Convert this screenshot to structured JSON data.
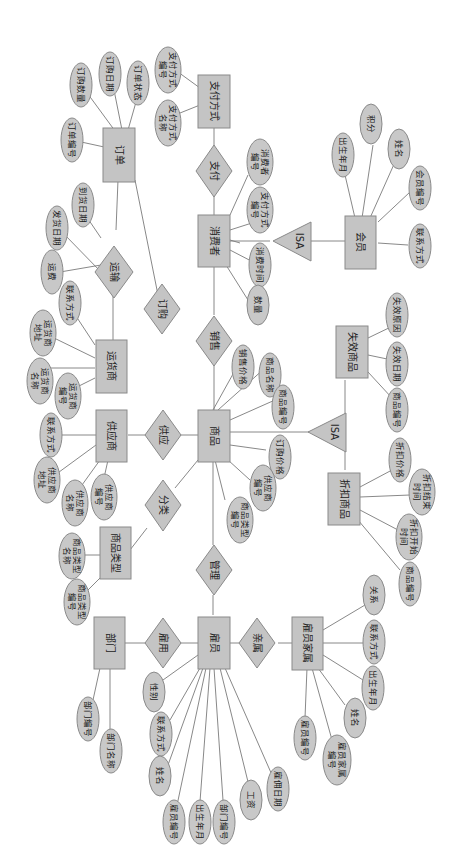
{
  "diagram": {
    "type": "ER diagram (Chen notation), rendered rotated 90° clockwise",
    "entities": [
      {
        "id": "order",
        "label": "订单"
      },
      {
        "id": "payment",
        "label": "支付方式"
      },
      {
        "id": "carrier",
        "label": "运货商"
      },
      {
        "id": "consumer",
        "label": "消费者"
      },
      {
        "id": "member",
        "label": "会员"
      },
      {
        "id": "supplier",
        "label": "供应商"
      },
      {
        "id": "product",
        "label": "商品"
      },
      {
        "id": "category",
        "label": "商品类型"
      },
      {
        "id": "expired",
        "label": "失效商品"
      },
      {
        "id": "discount",
        "label": "折扣商品"
      },
      {
        "id": "dept",
        "label": "部门"
      },
      {
        "id": "employee",
        "label": "雇员"
      },
      {
        "id": "family",
        "label": "雇员家属"
      }
    ],
    "relationships": [
      {
        "id": "pay",
        "label": "支付"
      },
      {
        "id": "ship",
        "label": "运输"
      },
      {
        "id": "purchase",
        "label": "订购"
      },
      {
        "id": "sell",
        "label": "销售"
      },
      {
        "id": "supply",
        "label": "供应"
      },
      {
        "id": "classify",
        "label": "分类"
      },
      {
        "id": "manage",
        "label": "管理"
      },
      {
        "id": "hire",
        "label": "雇用"
      },
      {
        "id": "dependent",
        "label": "亲属"
      }
    ],
    "isa": [
      {
        "id": "isa_consumer",
        "label": "ISA",
        "parent": "消费者",
        "child": "会员"
      },
      {
        "id": "isa_product",
        "label": "ISA",
        "parent": "商品",
        "children": [
          "失效商品",
          "折扣商品"
        ]
      }
    ],
    "attributes": {
      "order": [
        "订单编号",
        "订购数量",
        "订购日期",
        "订单状态"
      ],
      "payment": [
        "支付方式名称",
        "支付方式编号"
      ],
      "ship": [
        "到货日期",
        "发货日期",
        "运费"
      ],
      "carrier": [
        "联系方式",
        "运货商地址",
        "运货商名称",
        "运货商编号"
      ],
      "consumer": [
        "消费者编号",
        "支付方式编号",
        "消费时间",
        "数量"
      ],
      "member": [
        "出生年月",
        "积分",
        "姓名",
        "会员编号",
        "联系方式"
      ],
      "supplier": [
        "联系方式",
        "供应商地址",
        "供应商名称",
        "供应商编号"
      ],
      "product": [
        "销售价格",
        "商品名称",
        "商品编号",
        "订购价格",
        "供应商编号",
        "商品类型编号"
      ],
      "category": [
        "商品类型名称",
        "商品类型编号"
      ],
      "expired": [
        "失效原因",
        "失效日期",
        "商品编号"
      ],
      "discount": [
        "折扣价格",
        "折扣结束时间",
        "折扣开始时间",
        "商品编号"
      ],
      "dept": [
        "部门编号",
        "部门名称"
      ],
      "employee": [
        "性别",
        "联系方式",
        "姓名",
        "雇员编号",
        "出生年月",
        "部门编号",
        "工资",
        "雇佣日期"
      ],
      "family": [
        "关系",
        "联系方式",
        "出生年月",
        "姓名",
        "雇员家属编号",
        "雇员编号"
      ]
    }
  }
}
